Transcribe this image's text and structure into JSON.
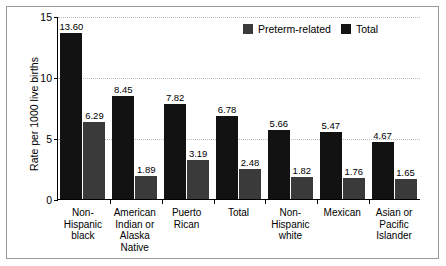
{
  "chart_data": {
    "type": "bar",
    "title": "",
    "subtitle": "",
    "xlabel": "",
    "ylabel": "Rate per 1000 live births",
    "ylim": [
      0,
      15
    ],
    "yticks": [
      0,
      5,
      10,
      15
    ],
    "ytick_labels": [
      "0",
      "5",
      "10",
      "15"
    ],
    "grid": true,
    "grid_axis": "y",
    "legend_position": "top-right",
    "categories": [
      "Non-\nHispanic\nblack",
      "American\nIndian or\nAlaska\nNative",
      "Puerto\nRican",
      "Total",
      "Non-\nHispanic\nwhite",
      "Mexican",
      "Asian or\nPacific\nIslander"
    ],
    "series": [
      {
        "name": "Total",
        "color": "#121212",
        "values": [
          13.6,
          8.45,
          7.82,
          6.78,
          5.66,
          5.47,
          4.67
        ],
        "labels": [
          "13.60",
          "8.45",
          "7.82",
          "6.78",
          "5.66",
          "5.47",
          "4.67"
        ]
      },
      {
        "name": "Preterm-related",
        "color": "#3a3a3a",
        "values": [
          6.29,
          1.89,
          3.19,
          2.48,
          1.82,
          1.76,
          1.65
        ],
        "labels": [
          "6.29",
          "1.89",
          "3.19",
          "2.48",
          "1.82",
          "1.76",
          "1.65"
        ]
      }
    ]
  },
  "axis": {
    "y_title": "Rate per 1000 live births",
    "y_ticks": [
      {
        "value": 15,
        "label": "15"
      },
      {
        "value": 10,
        "label": "10"
      },
      {
        "value": 5,
        "label": "5"
      },
      {
        "value": 0,
        "label": "0"
      }
    ]
  },
  "legend": {
    "entries": [
      {
        "label": "Preterm-related",
        "color": "#3a3a3a"
      },
      {
        "label": "Total",
        "color": "#121212"
      }
    ]
  },
  "categories": [
    {
      "lines": [
        "Non-",
        "Hispanic",
        "black"
      ]
    },
    {
      "lines": [
        "American",
        "Indian or",
        "Alaska",
        "Native"
      ]
    },
    {
      "lines": [
        "Puerto",
        "Rican"
      ]
    },
    {
      "lines": [
        "Total"
      ]
    },
    {
      "lines": [
        "Non-",
        "Hispanic",
        "white"
      ]
    },
    {
      "lines": [
        "Mexican"
      ]
    },
    {
      "lines": [
        "Asian or",
        "Pacific",
        "Islander"
      ]
    }
  ]
}
